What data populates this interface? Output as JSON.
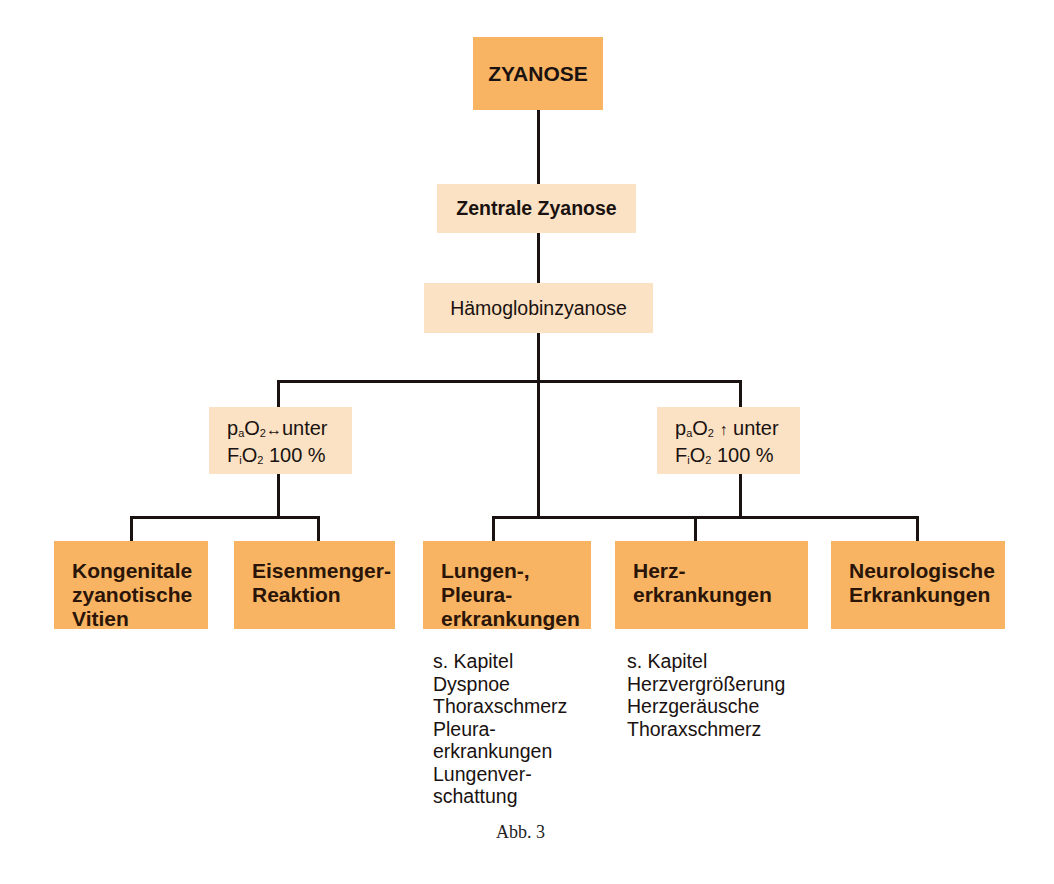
{
  "diagram": {
    "root": {
      "label": "ZYANOSE",
      "color": "#f8b462"
    },
    "level1": {
      "label": "Zentrale Zyanose",
      "color": "#fbe2c4"
    },
    "level2": {
      "label": "Hämoglobinzyanose",
      "color": "#fbe2c4"
    },
    "conditions": [
      {
        "line1_p": "p",
        "line1_sub_a": "a",
        "line1_o": "O",
        "line1_sub_2": "2",
        "symbol": "↔",
        "line1_rest": "unter",
        "line2_f": "F",
        "line2_sub_i": "i",
        "line2_o": "O",
        "line2_sub_2": "2",
        "line2_rest": "100 %"
      },
      {
        "line1_p": "p",
        "line1_sub_a": "a",
        "line1_o": "O",
        "line1_sub_2": "2",
        "symbol": "↑",
        "line1_rest": "unter",
        "line2_f": "F",
        "line2_sub_i": "i",
        "line2_o": "O",
        "line2_sub_2": "2",
        "line2_rest": "100 %"
      }
    ],
    "leaves": [
      {
        "lines": [
          "Kongenitale",
          "zyanotische",
          "Vitien"
        ]
      },
      {
        "lines": [
          "Eisenmenger-",
          "Reaktion"
        ]
      },
      {
        "lines": [
          "Lungen-,",
          "Pleura-",
          "erkrankungen"
        ]
      },
      {
        "lines": [
          "Herz-",
          "erkrankungen"
        ]
      },
      {
        "lines": [
          "Neurologische",
          "Erkrankungen"
        ]
      }
    ],
    "notes": [
      {
        "lines": [
          "s. Kapitel",
          "Dyspnoe",
          "Thoraxschmerz",
          "Pleura-",
          "erkrankungen",
          "Lungenver-",
          "schattung"
        ]
      },
      {
        "lines": [
          "s. Kapitel",
          "Herzvergrößerung",
          "Herzgeräusche",
          "Thoraxschmerz"
        ]
      }
    ],
    "caption": "Abb. 3",
    "colors": {
      "primary": "#f8b462",
      "secondary": "#fbe2c4",
      "line": "#1a1210"
    }
  }
}
